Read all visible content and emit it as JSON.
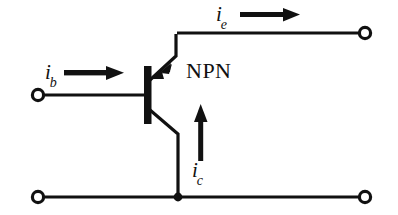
{
  "figure": {
    "device_label": "NPN",
    "ink_color": "#111111",
    "background_color": "#ffffff"
  },
  "labels": {
    "base_current": {
      "symbol": "i",
      "subscript": "b",
      "name": "base current"
    },
    "emitter_current": {
      "symbol": "i",
      "subscript": "e",
      "name": "emitter current"
    },
    "collector_current": {
      "symbol": "i",
      "subscript": "c",
      "name": "collector current"
    }
  },
  "arrows": {
    "base_arrow_direction": "right",
    "emitter_arrow_direction": "right",
    "collector_arrow_direction": "up",
    "emitter_symbol_arrow_direction": "down-left"
  },
  "terminals": {
    "count": 4,
    "style": "open-circle",
    "items": [
      {
        "name": "base-terminal",
        "x": 38,
        "y": 95
      },
      {
        "name": "emitter-terminal",
        "x": 365,
        "y": 33
      },
      {
        "name": "bottom-left-terminal",
        "x": 38,
        "y": 197
      },
      {
        "name": "bottom-right-terminal",
        "x": 365,
        "y": 197
      }
    ]
  },
  "junction": {
    "name": "collector-junction-node",
    "style": "filled-dot",
    "x": 178,
    "y": 197
  },
  "transistor": {
    "type": "NPN",
    "base_bar": {
      "x": 144,
      "y_top": 66,
      "y_bottom": 123,
      "width": 7
    }
  }
}
